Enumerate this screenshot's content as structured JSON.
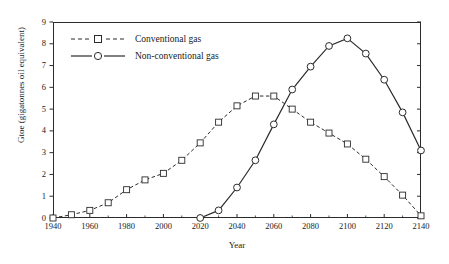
{
  "chart_data": {
    "type": "line",
    "title": "",
    "xlabel": "Year",
    "ylabel": "Gtoe (gigatonnes oil equivalent)",
    "xlim": [
      1940,
      2140
    ],
    "ylim": [
      0,
      9
    ],
    "grid": false,
    "legend_position": "top-left",
    "x_ticks": [
      1940,
      1960,
      1980,
      2000,
      2020,
      2040,
      2060,
      2080,
      2100,
      2120,
      2140
    ],
    "x_minor_step": 10,
    "y_ticks": [
      0,
      1,
      2,
      3,
      4,
      5,
      6,
      7,
      8,
      9
    ],
    "series": [
      {
        "name": "Conventional gas",
        "marker": "square-open",
        "line_style": "dashed",
        "color": "#2b2b2b",
        "x": [
          1940,
          1950,
          1960,
          1970,
          1980,
          1990,
          2000,
          2010,
          2020,
          2030,
          2040,
          2050,
          2060,
          2070,
          2080,
          2090,
          2100,
          2110,
          2120,
          2130,
          2140
        ],
        "values": [
          0.0,
          0.15,
          0.35,
          0.7,
          1.3,
          1.75,
          2.05,
          2.65,
          3.45,
          4.4,
          5.15,
          5.6,
          5.6,
          5.0,
          4.4,
          3.9,
          3.4,
          2.7,
          1.9,
          1.05,
          0.1
        ]
      },
      {
        "name": "Non-conventional gas",
        "marker": "circle-open",
        "line_style": "solid",
        "color": "#2b2b2b",
        "x": [
          2020,
          2030,
          2040,
          2050,
          2060,
          2070,
          2080,
          2090,
          2100,
          2110,
          2120,
          2130,
          2140
        ],
        "values": [
          0.0,
          0.35,
          1.4,
          2.65,
          4.3,
          5.9,
          6.95,
          7.9,
          8.25,
          7.55,
          6.35,
          4.85,
          3.1
        ]
      }
    ]
  },
  "legend": {
    "items": [
      {
        "label": "Conventional gas"
      },
      {
        "label": "Non-conventional gas"
      }
    ]
  }
}
